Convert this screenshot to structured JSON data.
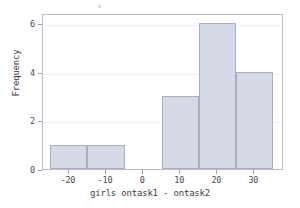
{
  "chart_data": {
    "type": "bar",
    "title": "",
    "subtitle": "",
    "xlabel": "girls ontask1 - ontask2",
    "ylabel": "Frequency",
    "xlim": [
      -27,
      38
    ],
    "ylim": [
      0,
      6.4
    ],
    "grid": true,
    "legend": null,
    "bin_width": 10,
    "bins": [
      {
        "left": -25,
        "right": -15,
        "value": 1
      },
      {
        "left": -15,
        "right": -5,
        "value": 1
      },
      {
        "left": 5,
        "right": 15,
        "value": 3
      },
      {
        "left": 15,
        "right": 25,
        "value": 6
      },
      {
        "left": 25,
        "right": 35,
        "value": 4
      }
    ],
    "categories": [
      "-25 to -15",
      "-15 to -5",
      "5 to 15",
      "15 to 25",
      "25 to 35"
    ],
    "values": [
      1,
      1,
      3,
      6,
      4
    ],
    "xticks": [
      -20,
      -10,
      0,
      10,
      20,
      30
    ],
    "xticklabels": [
      "-20",
      "-10",
      "0",
      "10",
      "20",
      "30"
    ],
    "yticks": [
      0,
      2,
      4,
      6
    ],
    "yticklabels": [
      "0",
      "2",
      "4",
      "6"
    ],
    "colors": {
      "bar_fill": "#d6dae7",
      "bar_edge": "#a8aec6",
      "frame": "#b9bcc6",
      "grid": "#eceef4",
      "text": "#3c3c44",
      "background": "#ffffff"
    }
  }
}
